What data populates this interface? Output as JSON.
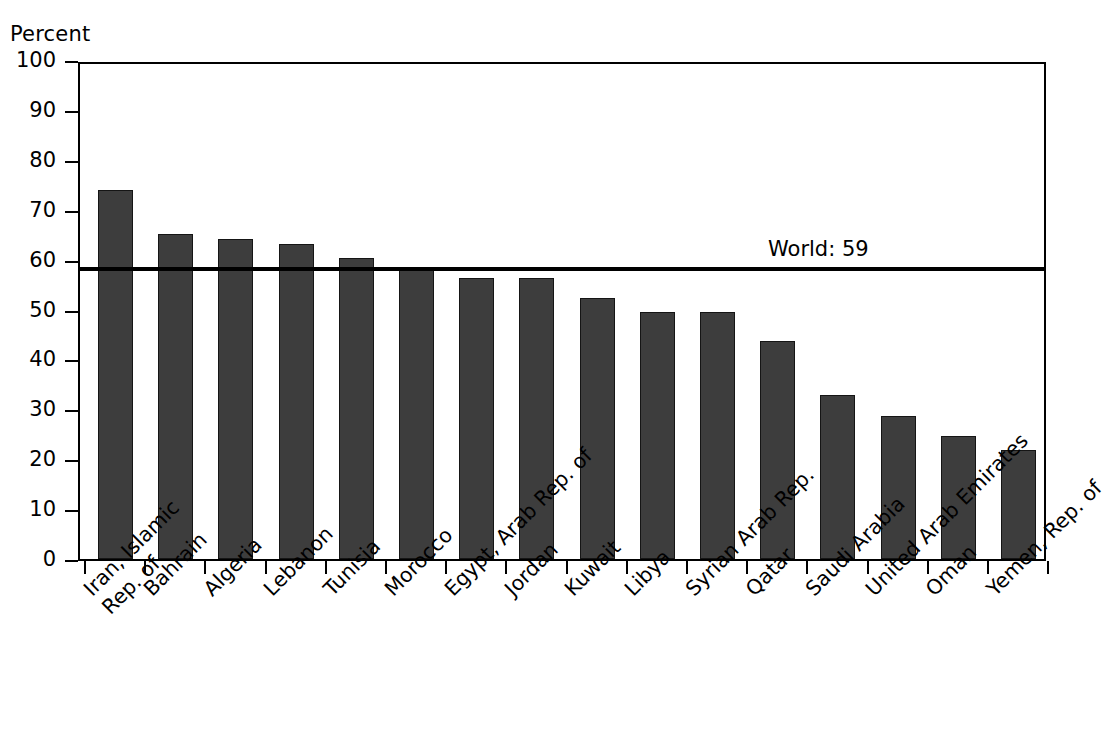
{
  "chart_data": {
    "type": "bar",
    "title": "",
    "subtitle": "",
    "xlabel": "",
    "ylabel": "Percent",
    "ylim": [
      0,
      100
    ],
    "yticks": [
      0,
      10,
      20,
      30,
      40,
      50,
      60,
      70,
      80,
      90,
      100
    ],
    "ytick_labels": [
      "0",
      "10",
      "20",
      "30",
      "40",
      "50",
      "60",
      "70",
      "80",
      "90",
      "100"
    ],
    "grid": false,
    "legend": "none",
    "bar_color": "#3d3d3d",
    "bar_edge_color": "#151515",
    "axis_color": "#000000",
    "background": "#ffffff",
    "categories": [
      "Iran, Islamic Rep. of",
      "Bahrain",
      "Algeria",
      "Lebanon",
      "Tunisia",
      "Morocco",
      "Egypt, Arab Rep. of",
      "Jordan",
      "Kuwait",
      "Libya",
      "Syrian Arab Rep.",
      "Qatar",
      "Saudi Arabia",
      "United Arab Emirates",
      "Oman",
      "Yemen, Rep. of"
    ],
    "category_lines": [
      [
        "Iran, Islamic",
        "Rep. of"
      ],
      [
        "Bahrain"
      ],
      [
        "Algeria"
      ],
      [
        "Lebanon"
      ],
      [
        "Tunisia"
      ],
      [
        "Morocco"
      ],
      [
        "Egypt, Arab Rep. of"
      ],
      [
        "Jordan"
      ],
      [
        "Kuwait"
      ],
      [
        "Libya"
      ],
      [
        "Syrian Arab Rep."
      ],
      [
        "Qatar"
      ],
      [
        "Saudi Arabia"
      ],
      [
        "United Arab Emirates"
      ],
      [
        "Oman"
      ],
      [
        "Yemen, Rep. of"
      ]
    ],
    "values": [
      74,
      65.2,
      64.2,
      63.1,
      60.3,
      58.5,
      56.3,
      56.3,
      52.4,
      49.6,
      49.6,
      43.7,
      32.8,
      28.7,
      24.7,
      21.8
    ],
    "annotations": [
      {
        "name": "world-reference-line",
        "label": "World: 59",
        "value": 59,
        "orientation": "horizontal"
      }
    ]
  }
}
